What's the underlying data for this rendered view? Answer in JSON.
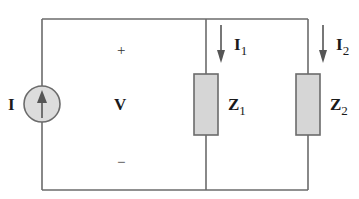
{
  "diagram": {
    "type": "parallel circuit",
    "source": {
      "label": "I",
      "kind": "current source",
      "direction": "up"
    },
    "voltage": {
      "label": "V",
      "plus": "+",
      "minus": "−"
    },
    "branches": [
      {
        "current_label": "I",
        "current_sub": "1",
        "impedance_label": "Z",
        "impedance_sub": "1"
      },
      {
        "current_label": "I",
        "current_sub": "2",
        "impedance_label": "Z",
        "impedance_sub": "2"
      }
    ],
    "colors": {
      "wire": "#6b6b6b",
      "component_fill": "#d6d6d6",
      "text": "#1a1a1a"
    }
  }
}
